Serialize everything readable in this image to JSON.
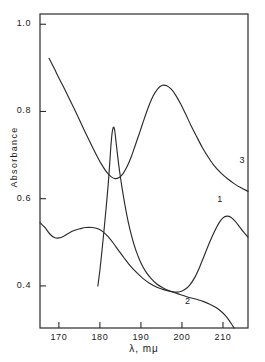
{
  "chart_data": {
    "type": "line",
    "title": "",
    "xlabel": "λ, mμ",
    "ylabel": "Absorbance",
    "xlim": [
      165.4,
      216.1
    ],
    "ylim": [
      0.3035,
      1.0235
    ],
    "xticks": [
      170,
      180,
      190,
      200,
      210
    ],
    "xtick_labels": [
      "170",
      "180",
      "190",
      "200",
      "210"
    ],
    "yticks": [
      0.4,
      0.6,
      0.8,
      1.0
    ],
    "ytick_labels": [
      "0.4",
      "0.6",
      "0.8",
      "1.0"
    ],
    "grid": false,
    "legend": "inline curve labels",
    "frame": "full box",
    "line_color": "#2b2b2b",
    "background_color": "#ffffff",
    "series": [
      {
        "name": "1",
        "label": "1",
        "label_x": 209.6,
        "label_y": 0.596,
        "points": [
          [
            165.4,
            0.545
          ],
          [
            166.6,
            0.534
          ],
          [
            167.8,
            0.519
          ],
          [
            168.9,
            0.511
          ],
          [
            170.0,
            0.51
          ],
          [
            171.2,
            0.514
          ],
          [
            172.4,
            0.521
          ],
          [
            173.7,
            0.527
          ],
          [
            175.1,
            0.531
          ],
          [
            176.6,
            0.534
          ],
          [
            178.1,
            0.534
          ],
          [
            179.5,
            0.531
          ],
          [
            180.8,
            0.524
          ],
          [
            182.0,
            0.513
          ],
          [
            183.2,
            0.499
          ],
          [
            184.5,
            0.482
          ],
          [
            185.9,
            0.464
          ],
          [
            187.3,
            0.447
          ],
          [
            188.8,
            0.432
          ],
          [
            190.4,
            0.418
          ],
          [
            192.1,
            0.406
          ],
          [
            193.9,
            0.397
          ],
          [
            195.7,
            0.391
          ],
          [
            197.5,
            0.387
          ],
          [
            199.2,
            0.386
          ],
          [
            200.6,
            0.391
          ],
          [
            201.9,
            0.402
          ],
          [
            203.1,
            0.419
          ],
          [
            204.3,
            0.443
          ],
          [
            205.5,
            0.471
          ],
          [
            206.7,
            0.499
          ],
          [
            207.9,
            0.524
          ],
          [
            209.0,
            0.544
          ],
          [
            210.0,
            0.556
          ],
          [
            211.0,
            0.56
          ],
          [
            212.0,
            0.557
          ],
          [
            213.0,
            0.548
          ],
          [
            214.0,
            0.536
          ],
          [
            215.0,
            0.524
          ],
          [
            216.1,
            0.512
          ]
        ]
      },
      {
        "name": "2",
        "label": "2",
        "label_x": 201.7,
        "label_y": 0.363,
        "points": [
          [
            179.5,
            0.4
          ],
          [
            180.0,
            0.436
          ],
          [
            180.5,
            0.48
          ],
          [
            181.0,
            0.527
          ],
          [
            181.5,
            0.577
          ],
          [
            182.0,
            0.63
          ],
          [
            182.4,
            0.682
          ],
          [
            182.7,
            0.723
          ],
          [
            183.0,
            0.752
          ],
          [
            183.3,
            0.764
          ],
          [
            183.6,
            0.757
          ],
          [
            183.9,
            0.733
          ],
          [
            184.3,
            0.7
          ],
          [
            184.8,
            0.663
          ],
          [
            185.4,
            0.625
          ],
          [
            186.1,
            0.586
          ],
          [
            186.9,
            0.547
          ],
          [
            187.8,
            0.512
          ],
          [
            188.8,
            0.481
          ],
          [
            189.9,
            0.455
          ],
          [
            191.1,
            0.434
          ],
          [
            192.4,
            0.418
          ],
          [
            193.8,
            0.405
          ],
          [
            195.3,
            0.396
          ],
          [
            196.9,
            0.389
          ],
          [
            198.6,
            0.383
          ],
          [
            200.3,
            0.378
          ],
          [
            202.0,
            0.373
          ],
          [
            203.7,
            0.369
          ],
          [
            205.3,
            0.364
          ],
          [
            206.8,
            0.358
          ],
          [
            208.2,
            0.351
          ],
          [
            209.5,
            0.342
          ],
          [
            210.6,
            0.332
          ],
          [
            211.5,
            0.321
          ],
          [
            212.2,
            0.311
          ],
          [
            212.7,
            0.3035
          ]
        ]
      },
      {
        "name": "3",
        "label": "3",
        "label_x": 215.0,
        "label_y": 0.686,
        "points": [
          [
            167.6,
            0.922
          ],
          [
            168.8,
            0.9
          ],
          [
            170.0,
            0.877
          ],
          [
            171.3,
            0.853
          ],
          [
            172.6,
            0.828
          ],
          [
            174.0,
            0.801
          ],
          [
            175.4,
            0.773
          ],
          [
            176.8,
            0.745
          ],
          [
            178.2,
            0.718
          ],
          [
            179.5,
            0.694
          ],
          [
            180.7,
            0.674
          ],
          [
            181.8,
            0.659
          ],
          [
            182.8,
            0.65
          ],
          [
            183.7,
            0.646
          ],
          [
            184.6,
            0.648
          ],
          [
            185.6,
            0.657
          ],
          [
            186.6,
            0.673
          ],
          [
            187.6,
            0.695
          ],
          [
            188.6,
            0.722
          ],
          [
            189.7,
            0.752
          ],
          [
            190.8,
            0.783
          ],
          [
            191.9,
            0.812
          ],
          [
            193.0,
            0.836
          ],
          [
            194.1,
            0.852
          ],
          [
            195.2,
            0.86
          ],
          [
            196.3,
            0.859
          ],
          [
            197.4,
            0.851
          ],
          [
            198.5,
            0.837
          ],
          [
            199.7,
            0.817
          ],
          [
            200.9,
            0.794
          ],
          [
            202.2,
            0.768
          ],
          [
            203.6,
            0.742
          ],
          [
            205.0,
            0.717
          ],
          [
            206.5,
            0.694
          ],
          [
            208.0,
            0.674
          ],
          [
            209.6,
            0.658
          ],
          [
            211.2,
            0.645
          ],
          [
            212.8,
            0.634
          ],
          [
            214.4,
            0.625
          ],
          [
            216.1,
            0.617
          ]
        ]
      }
    ]
  }
}
